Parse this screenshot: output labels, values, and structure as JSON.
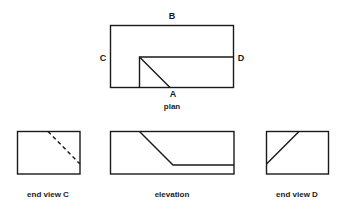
{
  "plan": {
    "caption": "plan",
    "labels": {
      "top": "B",
      "left": "C",
      "right": "D",
      "bottom": "A"
    }
  },
  "end_view_c": {
    "caption": "end view C"
  },
  "elevation": {
    "caption": "elevation"
  },
  "end_view_d": {
    "caption": "end view D"
  },
  "colors": {
    "line": "#1a1a1a",
    "background": "#ffffff"
  }
}
